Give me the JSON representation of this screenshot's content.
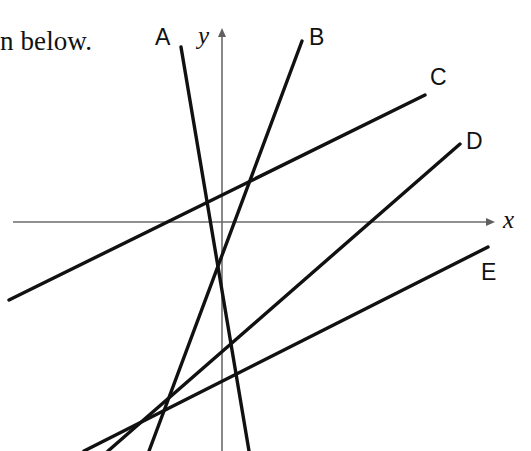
{
  "page": {
    "width": 531,
    "height": 451,
    "background": "#ffffff",
    "ink_color": "#111111",
    "axis_color": "#6b6b6b"
  },
  "prose": {
    "text": "n below.",
    "x": 0,
    "y": 26
  },
  "axes": {
    "x_axis": {
      "label": "x",
      "label_x": 503,
      "label_y": 206,
      "x1": 13,
      "y1": 222,
      "x2": 487,
      "y2": 222,
      "color": "#6b6b6b",
      "width": 1.6,
      "arrow": "right"
    },
    "y_axis": {
      "label": "y",
      "label_x": 198,
      "label_y": 22,
      "x1": 222,
      "y1": 451,
      "x2": 222,
      "y2": 36,
      "color": "#6b6b6b",
      "width": 1.6,
      "arrow": "up"
    }
  },
  "chart_data": {
    "type": "line",
    "title": "",
    "xlabel": "x",
    "ylabel": "y",
    "grid": false,
    "legend": "inline-end-labels",
    "origin": {
      "x": 222,
      "y": 222
    },
    "series": [
      {
        "name": "A",
        "label": "A",
        "label_x": 155,
        "label_y": 24,
        "x1": 181,
        "y1": 47,
        "x2": 249,
        "y2": 451,
        "stroke_width": 3.4,
        "slope_sign": "negative-steep"
      },
      {
        "name": "B",
        "label": "B",
        "label_x": 309,
        "label_y": 24,
        "x1": 302,
        "y1": 41,
        "x2": 149,
        "y2": 451,
        "stroke_width": 3.4,
        "slope_sign": "positive-steep"
      },
      {
        "name": "C",
        "label": "C",
        "label_x": 430,
        "label_y": 64,
        "x1": 9,
        "y1": 300,
        "x2": 425,
        "y2": 95,
        "stroke_width": 3.4,
        "slope_sign": "positive-shallow"
      },
      {
        "name": "D",
        "label": "D",
        "label_x": 466,
        "label_y": 128,
        "x1": 460,
        "y1": 144,
        "x2": 108,
        "y2": 451,
        "stroke_width": 3.4,
        "slope_sign": "positive-medium"
      },
      {
        "name": "E",
        "label": "E",
        "label_x": 481,
        "label_y": 259,
        "x1": 488,
        "y1": 247,
        "x2": 84,
        "y2": 451,
        "stroke_width": 3.4,
        "slope_sign": "positive-shallow"
      }
    ]
  }
}
